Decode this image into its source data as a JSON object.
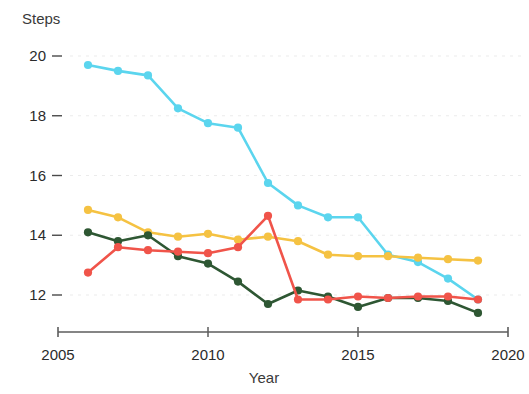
{
  "chart_data": {
    "type": "line",
    "title": "",
    "ylabel": "Steps",
    "xlabel": "Year",
    "x": [
      2006,
      2007,
      2008,
      2009,
      2010,
      2011,
      2012,
      2013,
      2014,
      2015,
      2016,
      2017,
      2018,
      2019
    ],
    "xlim": [
      2005,
      2020
    ],
    "ylim": [
      11.0,
      20.4
    ],
    "xticks": [
      2005,
      2010,
      2015,
      2020
    ],
    "xtick_labels": [
      "2005",
      "2010",
      "2015",
      "2020"
    ],
    "yticks": [
      12,
      14,
      16,
      18,
      20
    ],
    "ytick_labels": [
      "12",
      "14",
      "16",
      "18",
      "20"
    ],
    "grid": "horizontal-dotted",
    "legend": "none",
    "markers": "filled-circles",
    "series": [
      {
        "name": "cyan",
        "color": "#5BD5EE",
        "values": [
          19.7,
          19.5,
          19.35,
          18.25,
          17.75,
          17.6,
          15.75,
          15.0,
          14.6,
          14.6,
          13.35,
          13.1,
          12.55,
          11.85
        ]
      },
      {
        "name": "yellow",
        "color": "#F5C242",
        "values": [
          14.85,
          14.6,
          14.1,
          13.95,
          14.05,
          13.85,
          13.95,
          13.8,
          13.35,
          13.3,
          13.3,
          13.25,
          13.2,
          13.15
        ]
      },
      {
        "name": "dark-green",
        "color": "#2E5733",
        "values": [
          14.1,
          13.8,
          14.0,
          13.3,
          13.05,
          12.45,
          11.7,
          12.15,
          11.95,
          11.6,
          11.9,
          11.9,
          11.8,
          11.4
        ]
      },
      {
        "name": "red",
        "color": "#F0544A",
        "values": [
          12.75,
          13.6,
          13.5,
          13.45,
          13.4,
          13.6,
          14.65,
          11.85,
          11.85,
          11.95,
          11.9,
          11.95,
          11.95,
          11.85
        ]
      }
    ]
  },
  "axes": {
    "y_title": "Steps",
    "x_title": "Year"
  }
}
